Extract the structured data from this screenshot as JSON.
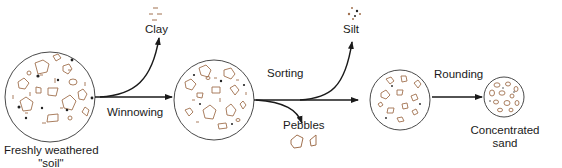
{
  "diagram": {
    "colors": {
      "line": "#1a1a1a",
      "circle_outline": "#4a4a4a",
      "grain_outline": "#a0704e",
      "dot": "#222222"
    },
    "stages": [
      {
        "id": "fresh-soil",
        "label_line1": "Freshly weathered",
        "label_line2": "\"soil\""
      },
      {
        "id": "winnowed",
        "label_line1": ""
      },
      {
        "id": "sorted",
        "label_line1": ""
      },
      {
        "id": "concentrated-sand",
        "label_line1": "Concentrated",
        "label_line2": "sand"
      }
    ],
    "processes": [
      {
        "id": "winnowing",
        "label": "Winnowing",
        "byproduct": "Clay"
      },
      {
        "id": "sorting",
        "label": "Sorting",
        "byproducts": [
          "Silt",
          "Pebbles"
        ]
      },
      {
        "id": "rounding",
        "label": "Rounding"
      }
    ],
    "byproducts": {
      "clay": "Clay",
      "silt": "Silt",
      "pebbles": "Pebbles"
    }
  }
}
